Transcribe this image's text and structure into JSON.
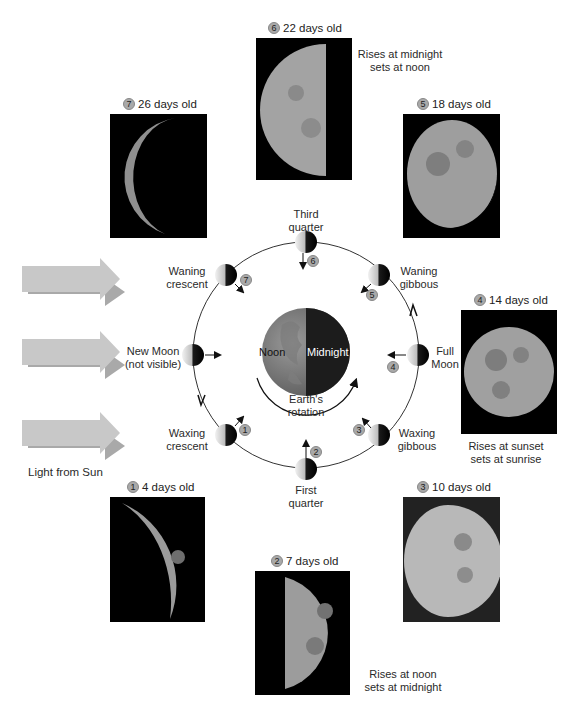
{
  "sun": {
    "label": "Light from Sun",
    "arrow_color": "#c4c4c4",
    "arrow_shadow_color": "#a8a8a8"
  },
  "earth": {
    "noon_label": "Noon",
    "midnight_label": "Midnight",
    "rotation_label_line1": "Earth's",
    "rotation_label_line2": "rotation"
  },
  "orbit_phases": [
    {
      "id": "new-moon",
      "line1": "New Moon",
      "line2": "(not visible)",
      "step": null
    },
    {
      "id": "waxing-crescent",
      "line1": "Waxing",
      "line2": "crescent",
      "step": "1"
    },
    {
      "id": "first-quarter",
      "line1": "First",
      "line2": "quarter",
      "step": "2"
    },
    {
      "id": "waxing-gibbous",
      "line1": "Waxing",
      "line2": "gibbous",
      "step": "3"
    },
    {
      "id": "full-moon",
      "line1": "Full",
      "line2": "Moon",
      "step": "4"
    },
    {
      "id": "waning-gibbous",
      "line1": "Waning",
      "line2": "gibbous",
      "step": "5"
    },
    {
      "id": "third-quarter",
      "line1": "Third",
      "line2": "quarter",
      "step": "6"
    },
    {
      "id": "waning-crescent",
      "line1": "Waning",
      "line2": "crescent",
      "step": "7"
    }
  ],
  "photos": [
    {
      "step": "1",
      "label": "4 days old"
    },
    {
      "step": "2",
      "label": "7 days old"
    },
    {
      "step": "3",
      "label": "10 days old"
    },
    {
      "step": "4",
      "label": "14 days old"
    },
    {
      "step": "5",
      "label": "18 days old"
    },
    {
      "step": "6",
      "label": "22 days old"
    },
    {
      "step": "7",
      "label": "26 days old"
    }
  ],
  "rise_set_notes": {
    "first_quarter": {
      "line1": "Rises at noon",
      "line2": "sets at midnight"
    },
    "full_moon": {
      "line1": "Rises at sunset",
      "line2": "sets at sunrise"
    },
    "third_quarter": {
      "line1": "Rises at midnight",
      "line2": "sets at noon"
    }
  }
}
